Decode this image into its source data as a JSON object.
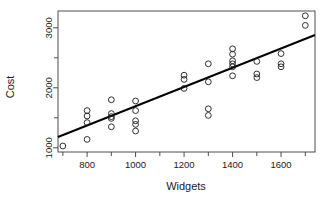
{
  "chart_data": {
    "type": "scatter",
    "title": "",
    "xlabel": "Widgets",
    "ylabel": "Cost",
    "xlim": [
      680,
      1740
    ],
    "ylim": [
      930,
      3280
    ],
    "grid": false,
    "legend": null,
    "x_ticks_major": [
      800,
      1000,
      1200,
      1400,
      1600
    ],
    "x_ticks_minor": [
      700,
      900,
      1100,
      1300,
      1500,
      1700
    ],
    "y_ticks_major": [
      1000,
      2000,
      3000
    ],
    "y_ticks_minor": [
      1500,
      2500
    ],
    "marker": "open-circle",
    "points": [
      {
        "x": 700,
        "y": 1030
      },
      {
        "x": 800,
        "y": 1620
      },
      {
        "x": 800,
        "y": 1530
      },
      {
        "x": 800,
        "y": 1420
      },
      {
        "x": 800,
        "y": 1140
      },
      {
        "x": 900,
        "y": 1800
      },
      {
        "x": 900,
        "y": 1570
      },
      {
        "x": 900,
        "y": 1520
      },
      {
        "x": 900,
        "y": 1490
      },
      {
        "x": 900,
        "y": 1350
      },
      {
        "x": 1000,
        "y": 1780
      },
      {
        "x": 1000,
        "y": 1620
      },
      {
        "x": 1000,
        "y": 1450
      },
      {
        "x": 1000,
        "y": 1390
      },
      {
        "x": 1000,
        "y": 1280
      },
      {
        "x": 1200,
        "y": 2210
      },
      {
        "x": 1200,
        "y": 2140
      },
      {
        "x": 1200,
        "y": 1990
      },
      {
        "x": 1300,
        "y": 2400
      },
      {
        "x": 1300,
        "y": 2100
      },
      {
        "x": 1300,
        "y": 1650
      },
      {
        "x": 1300,
        "y": 1540
      },
      {
        "x": 1400,
        "y": 2650
      },
      {
        "x": 1400,
        "y": 2560
      },
      {
        "x": 1400,
        "y": 2450
      },
      {
        "x": 1400,
        "y": 2400
      },
      {
        "x": 1400,
        "y": 2350
      },
      {
        "x": 1400,
        "y": 2200
      },
      {
        "x": 1500,
        "y": 2440
      },
      {
        "x": 1500,
        "y": 2230
      },
      {
        "x": 1500,
        "y": 2170
      },
      {
        "x": 1600,
        "y": 2570
      },
      {
        "x": 1600,
        "y": 2400
      },
      {
        "x": 1600,
        "y": 2350
      },
      {
        "x": 1700,
        "y": 3200
      },
      {
        "x": 1700,
        "y": 3040
      }
    ],
    "fit_line": {
      "type": "linear-regression",
      "x_start": 680,
      "y_start": 1180,
      "x_end": 1740,
      "y_end": 2880
    }
  }
}
